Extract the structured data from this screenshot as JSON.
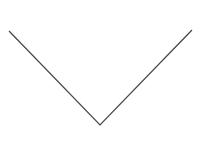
{
  "icon": {
    "name": "chevron-down-icon",
    "stroke_color": "#444444",
    "background": "#ffffff",
    "points": [
      [
        9,
        31
      ],
      [
        100,
        125
      ],
      [
        192,
        30
      ]
    ]
  }
}
